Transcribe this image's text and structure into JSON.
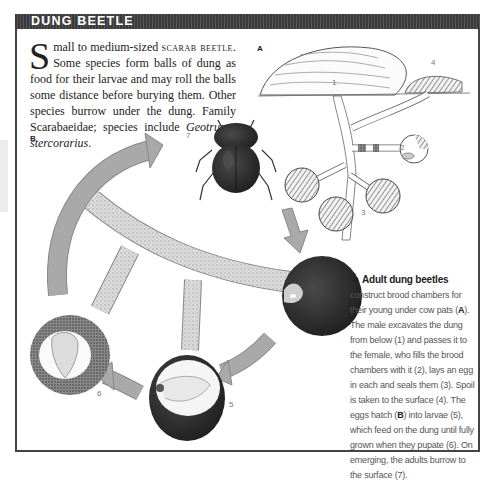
{
  "header": {
    "title": "DUNG BEETLE"
  },
  "intro": {
    "dropcap": "S",
    "text_1": "mall to medium-sized ",
    "scarab": "scarab beetle",
    "text_2": ". Some species form balls of dung as food for their larvae and may roll the balls some distance before burying them. Other species burrow under the dung. Family Scarabaeidae; species include ",
    "species": "Geotrupes stercorarius",
    "text_3": "."
  },
  "figure": {
    "panel_a_label": "A",
    "panel_b_label": "B",
    "labels": [
      "1",
      "2",
      "3",
      "4",
      "5",
      "6",
      "7"
    ],
    "colors": {
      "arrow": "#a9a9a9",
      "chamber_dark": "#2f2f2f",
      "tunnel": "#d4d4d4",
      "frame": "#444444",
      "title_bar": "#3a3a3a"
    }
  },
  "caption": {
    "arrow": "◄",
    "heading": "Adult dung beetles",
    "p1": " construct brood chambers for their young under cow pats (",
    "ref_a": "A",
    "p2": "). The male excavates the dung from below (1) and passes it to the female, who fills the brood chambers with it (2), lays an egg in each and seals them (3). Spoil is taken to the surface (4). The eggs hatch (",
    "ref_b": "B",
    "p3": ") into larvae (5), which feed on the dung until fully grown when they pupate (6). On emerging, the adults burrow to the surface (7)."
  }
}
